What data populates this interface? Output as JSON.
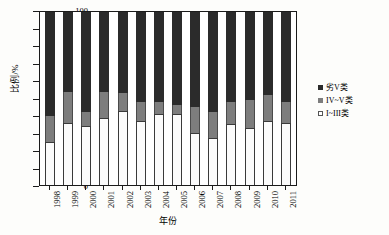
{
  "chart_data": {
    "type": "bar",
    "stacked": true,
    "title": "",
    "subtitle": "",
    "xlabel": "年份",
    "ylabel": "比例/%",
    "ylim": [
      0,
      100
    ],
    "yticks": [
      0,
      10,
      20,
      30,
      40,
      50,
      60,
      70,
      80,
      90,
      100
    ],
    "grid": false,
    "legend_position": "right",
    "categories": [
      "1998",
      "1999",
      "2000",
      "2001",
      "2002",
      "2003",
      "2004",
      "2005",
      "2006",
      "2007",
      "2008",
      "2009",
      "2010",
      "2011"
    ],
    "series": [
      {
        "name": "I~III类",
        "color": "#fbfbfb",
        "values": [
          25,
          36,
          34,
          39,
          43,
          37,
          41,
          41,
          30,
          27,
          35,
          33,
          37,
          36
        ]
      },
      {
        "name": "IV~V类",
        "color": "#7d7d7d",
        "values": [
          15,
          18,
          8,
          15,
          10,
          11,
          7,
          5,
          15,
          15,
          13,
          16,
          15,
          12
        ]
      },
      {
        "name": "劣V类",
        "color": "#2b2b2b",
        "values": [
          60,
          46,
          58,
          46,
          47,
          52,
          52,
          54,
          55,
          58,
          52,
          51,
          48,
          52
        ]
      }
    ],
    "cumulative_tops": {
      "I~III类": [
        25,
        36,
        34,
        39,
        43,
        37,
        41,
        41,
        30,
        27,
        35,
        33,
        37,
        36
      ],
      "IV~V类": [
        40,
        54,
        42,
        54,
        53,
        48,
        48,
        46,
        45,
        42,
        48,
        49,
        52,
        48
      ]
    }
  },
  "legend": {
    "items": [
      {
        "label": "劣V类",
        "swatch": "black-swatch"
      },
      {
        "label": "IV~V类",
        "swatch": "gray-swatch"
      },
      {
        "label": "I~III类",
        "swatch": "white-swatch"
      }
    ]
  },
  "axes": {
    "y_title": "比例/%",
    "x_title": "年份"
  }
}
